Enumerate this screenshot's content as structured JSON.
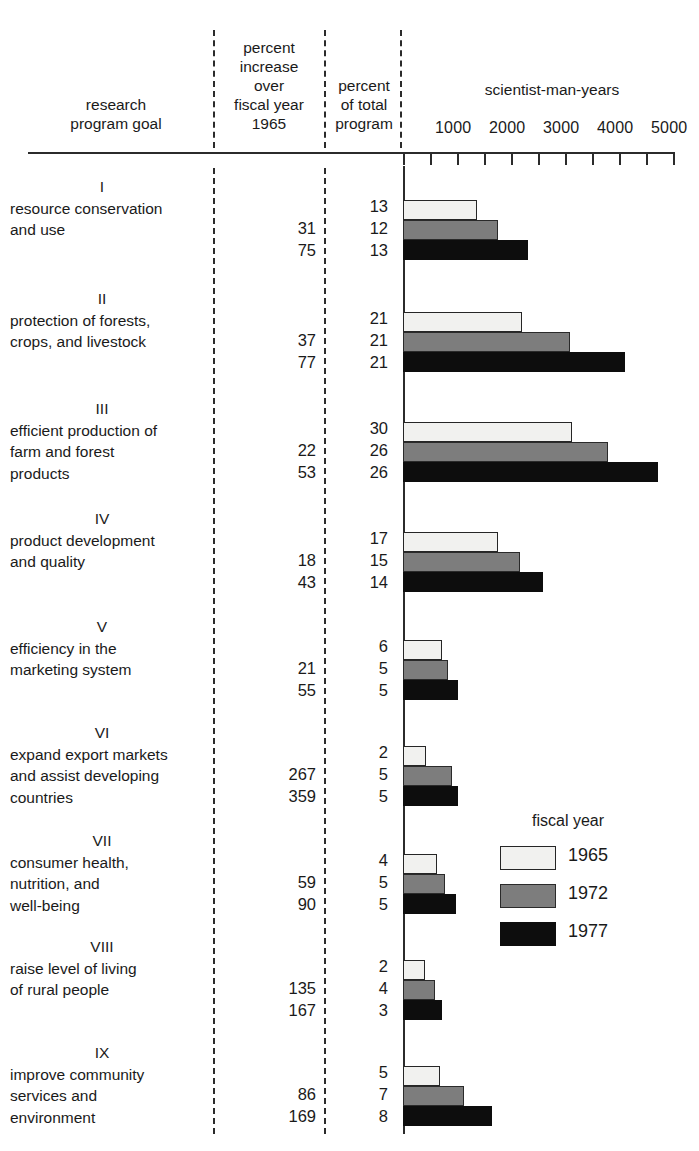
{
  "header": {
    "col_goal": "research\nprogram goal",
    "col_increase": "percent\nincrease\nover\nfiscal year\n1965",
    "col_percent_total": "percent\nof total\nprogram",
    "axis_title": "scientist-man-years",
    "tick_labels": [
      "1000",
      "2000",
      "3000",
      "4000",
      "5000"
    ]
  },
  "legend": {
    "title": "fiscal year",
    "items": [
      {
        "label": "1965",
        "swatch": "y1965",
        "color": "#f1f1ef"
      },
      {
        "label": "1972",
        "swatch": "y1972",
        "color": "#7d7d7d"
      },
      {
        "label": "1977",
        "swatch": "y1977",
        "color": "#0d0d0d"
      }
    ]
  },
  "rows": [
    {
      "roman": "I",
      "text": "resource conservation\nand use",
      "increase": "\n31\n75",
      "percent_total": "13\n12\n13"
    },
    {
      "roman": "II",
      "text": "protection of forests,\ncrops, and livestock",
      "increase": "\n37\n77",
      "percent_total": "21\n21\n21"
    },
    {
      "roman": "III",
      "text": "efficient production of\nfarm and forest\nproducts",
      "increase": "\n22\n53",
      "percent_total": "30\n26\n26"
    },
    {
      "roman": "IV",
      "text": "product development\nand quality",
      "increase": "\n18\n43",
      "percent_total": "17\n15\n14"
    },
    {
      "roman": "V",
      "text": "efficiency in the\nmarketing system",
      "increase": "\n21\n55",
      "percent_total": "6\n5\n5"
    },
    {
      "roman": "VI",
      "text": "expand export markets\nand assist developing\ncountries",
      "increase": "\n267\n359",
      "percent_total": "2\n5\n5"
    },
    {
      "roman": "VII",
      "text": "consumer health,\nnutrition, and\nwell-being",
      "increase": "\n59\n90",
      "percent_total": "4\n5\n5"
    },
    {
      "roman": "VIII",
      "text": "raise level of living\nof rural people",
      "increase": "\n135\n167",
      "percent_total": "2\n4\n3"
    },
    {
      "roman": "IX",
      "text": "improve community\nservices and\nenvironment",
      "increase": "\n86\n169",
      "percent_total": "5\n7\n8"
    }
  ],
  "chart_data": {
    "type": "bar",
    "title": "scientist-man-years",
    "xlabel": "scientist-man-years",
    "ylabel": "research program goal",
    "orientation": "horizontal",
    "xlim": [
      0,
      5000
    ],
    "xticks": [
      0,
      500,
      1000,
      1500,
      2000,
      2500,
      3000,
      3500,
      4000,
      4500,
      5000
    ],
    "xticklabels_shown": [
      "1000",
      "2000",
      "3000",
      "4000",
      "5000"
    ],
    "grid": false,
    "legend_position": "right-middle",
    "legend_title": "fiscal year",
    "categories": [
      "I resource conservation and use",
      "II protection of forests, crops, and livestock",
      "III efficient production of farm and forest products",
      "IV product development and quality",
      "V efficiency in the marketing system",
      "VI expand export markets and assist developing countries",
      "VII consumer health, nutrition, and well-being",
      "VIII raise level of living of rural people",
      "IX improve community services and environment"
    ],
    "series": [
      {
        "name": "1965",
        "color": "#f1f1ef",
        "values": [
          1370,
          2200,
          3130,
          1760,
          720,
          420,
          630,
          400,
          690
        ]
      },
      {
        "name": "1972",
        "color": "#7d7d7d",
        "values": [
          1760,
          3090,
          3800,
          2170,
          830,
          910,
          780,
          590,
          1130
        ]
      },
      {
        "name": "1977",
        "color": "#0d0d0d",
        "values": [
          2320,
          4110,
          4720,
          2590,
          1020,
          1020,
          980,
          720,
          1650
        ]
      }
    ],
    "table_columns": [
      "research program goal",
      "percent increase over fiscal year 1965",
      "percent of total program"
    ],
    "percent_increase_over_1965": {
      "1972": [
        31,
        37,
        22,
        18,
        21,
        267,
        59,
        135,
        86
      ],
      "1977": [
        75,
        77,
        53,
        43,
        55,
        359,
        90,
        167,
        169
      ]
    },
    "percent_of_total_program": {
      "1965": [
        13,
        21,
        30,
        17,
        6,
        2,
        4,
        2,
        5
      ],
      "1972": [
        12,
        21,
        26,
        15,
        5,
        5,
        5,
        4,
        7
      ],
      "1977": [
        13,
        21,
        26,
        14,
        5,
        5,
        5,
        3,
        8
      ]
    }
  },
  "_geometry": {
    "axis_origin_x": 403,
    "px_per_1000": 54,
    "row_tops": [
      176,
      288,
      398,
      508,
      616,
      722,
      830,
      936,
      1042
    ],
    "bar_height": 20,
    "group_bar_offsets": [
      24,
      44,
      64
    ]
  }
}
